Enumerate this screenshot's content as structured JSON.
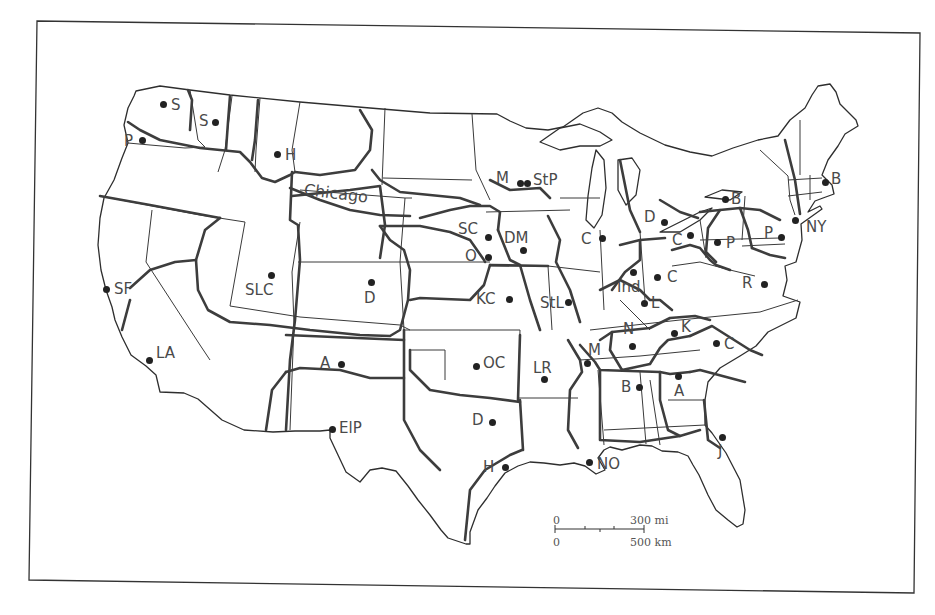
{
  "map": {
    "title": "Federal Reserve-style metropolitan trade regions of the United States",
    "accent_color": "#3d3d3d",
    "region_label": "Chicago",
    "cities": [
      {
        "label": "S",
        "x": 163,
        "y": 104,
        "lx": 171,
        "ly": 98
      },
      {
        "label": "S",
        "x": 215,
        "y": 122,
        "lx": 199,
        "ly": 114
      },
      {
        "label": "P",
        "x": 142,
        "y": 140,
        "lx": 124,
        "ly": 134
      },
      {
        "label": "H",
        "x": 277,
        "y": 154,
        "lx": 285,
        "ly": 148
      },
      {
        "label": "M",
        "x": 520,
        "y": 183,
        "lx": 496,
        "ly": 171
      },
      {
        "label": "StP",
        "x": 527,
        "y": 183,
        "lx": 533,
        "ly": 173
      },
      {
        "label": "B",
        "x": 825,
        "y": 182,
        "lx": 831,
        "ly": 172
      },
      {
        "label": "D",
        "x": 664,
        "y": 222,
        "lx": 644,
        "ly": 210
      },
      {
        "label": "B",
        "x": 725,
        "y": 199,
        "lx": 731,
        "ly": 192
      },
      {
        "label": "SC",
        "x": 488,
        "y": 237,
        "lx": 458,
        "ly": 222
      },
      {
        "label": "DM",
        "x": 523,
        "y": 250,
        "lx": 504,
        "ly": 231
      },
      {
        "label": "C",
        "x": 602,
        "y": 238,
        "lx": 581,
        "ly": 232
      },
      {
        "label": "C",
        "x": 690,
        "y": 235,
        "lx": 672,
        "ly": 233
      },
      {
        "label": "P",
        "x": 717,
        "y": 242,
        "lx": 726,
        "ly": 236
      },
      {
        "label": "P",
        "x": 781,
        "y": 237,
        "lx": 764,
        "ly": 226
      },
      {
        "label": "NY",
        "x": 795,
        "y": 220,
        "lx": 806,
        "ly": 220
      },
      {
        "label": "O",
        "x": 488,
        "y": 257,
        "lx": 465,
        "ly": 249
      },
      {
        "label": "SF",
        "x": 106,
        "y": 289,
        "lx": 114,
        "ly": 282
      },
      {
        "label": "SLC",
        "x": 271,
        "y": 275,
        "lx": 245,
        "ly": 283
      },
      {
        "label": "D",
        "x": 371,
        "y": 282,
        "lx": 364,
        "ly": 291
      },
      {
        "label": "KC",
        "x": 509,
        "y": 299,
        "lx": 476,
        "ly": 292
      },
      {
        "label": "StL",
        "x": 568,
        "y": 302,
        "lx": 540,
        "ly": 296
      },
      {
        "label": "Ind",
        "x": 633,
        "y": 272,
        "lx": 617,
        "ly": 280
      },
      {
        "label": "C",
        "x": 657,
        "y": 277,
        "lx": 667,
        "ly": 270
      },
      {
        "label": "L",
        "x": 644,
        "y": 303,
        "lx": 651,
        "ly": 296
      },
      {
        "label": "R",
        "x": 764,
        "y": 284,
        "lx": 742,
        "ly": 276
      },
      {
        "label": "N",
        "x": 632,
        "y": 346,
        "lx": 623,
        "ly": 322
      },
      {
        "label": "K",
        "x": 674,
        "y": 333,
        "lx": 681,
        "ly": 320
      },
      {
        "label": "C",
        "x": 716,
        "y": 343,
        "lx": 724,
        "ly": 337
      },
      {
        "label": "M",
        "x": 587,
        "y": 363,
        "lx": 588,
        "ly": 343
      },
      {
        "label": "LA",
        "x": 149,
        "y": 360,
        "lx": 156,
        "ly": 346
      },
      {
        "label": "A",
        "x": 341,
        "y": 364,
        "lx": 320,
        "ly": 356
      },
      {
        "label": "OC",
        "x": 476,
        "y": 366,
        "lx": 483,
        "ly": 356
      },
      {
        "label": "LR",
        "x": 544,
        "y": 379,
        "lx": 533,
        "ly": 361
      },
      {
        "label": "B",
        "x": 639,
        "y": 387,
        "lx": 621,
        "ly": 380
      },
      {
        "label": "A",
        "x": 678,
        "y": 376,
        "lx": 674,
        "ly": 384
      },
      {
        "label": "ElP",
        "x": 332,
        "y": 429,
        "lx": 339,
        "ly": 421
      },
      {
        "label": "D",
        "x": 492,
        "y": 422,
        "lx": 472,
        "ly": 413
      },
      {
        "label": "J",
        "x": 722,
        "y": 437,
        "lx": 718,
        "ly": 444
      },
      {
        "label": "H",
        "x": 505,
        "y": 467,
        "lx": 483,
        "ly": 460
      },
      {
        "label": "NO",
        "x": 589,
        "y": 462,
        "lx": 597,
        "ly": 457
      }
    ]
  },
  "scale_bar": {
    "top_zero": "0",
    "top_value": "300 mi",
    "bottom_zero": "0",
    "bottom_value": "500 km"
  }
}
